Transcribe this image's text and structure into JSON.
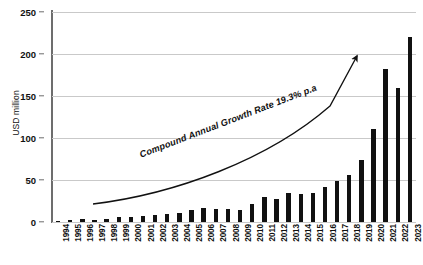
{
  "chart_data": {
    "type": "bar",
    "title": "",
    "subtitle": "",
    "xlabel": "",
    "ylabel": "USD million",
    "ylim": [
      0,
      250
    ],
    "yticks": [
      0,
      50,
      100,
      150,
      200,
      250
    ],
    "grid": true,
    "legend": null,
    "bar_color": "#111111",
    "categories": [
      "1994",
      "1995",
      "1996",
      "1997",
      "1998",
      "1999",
      "2000",
      "2001",
      "2002",
      "2003",
      "2004",
      "2005",
      "2006",
      "2007",
      "2008",
      "2009",
      "2010",
      "2011",
      "2012",
      "2013",
      "2014",
      "2015",
      "2016",
      "2017",
      "2018",
      "2019",
      "2020",
      "2021",
      "2022",
      "2023"
    ],
    "values": [
      1,
      2,
      3,
      2,
      4,
      6,
      6,
      7,
      8,
      9,
      11,
      14,
      17,
      16,
      15,
      14,
      21,
      30,
      27,
      35,
      33,
      34,
      42,
      49,
      56,
      74,
      111,
      182,
      159,
      220
    ],
    "annotations": [
      {
        "name": "cagr-label",
        "text": "Compound Annual Growth Rate 19.3% p.a"
      }
    ]
  }
}
